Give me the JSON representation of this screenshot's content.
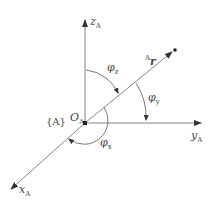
{
  "diagram": {
    "frame_label": "{A}",
    "origin": {
      "symbol": "O",
      "sub": "A"
    },
    "axes": {
      "z": {
        "symbol": "z",
        "sub": "A"
      },
      "y": {
        "symbol": "y",
        "sub": "A"
      },
      "x": {
        "symbol": "x",
        "sub": "A"
      }
    },
    "vector": {
      "pre_sup": "A",
      "symbol": "r"
    },
    "angles": {
      "phi_z": {
        "symbol": "φ",
        "sub": "z"
      },
      "phi_y": {
        "symbol": "φ",
        "sub": "y"
      },
      "phi_x": {
        "symbol": "φ",
        "sub": "x"
      }
    },
    "colors": {
      "line": "#555555",
      "text": "#444444"
    }
  }
}
